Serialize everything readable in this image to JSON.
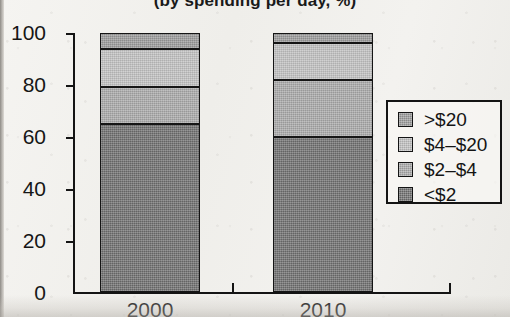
{
  "chart_data": {
    "type": "bar",
    "title": "(by spending per day, %)",
    "xlabel": "",
    "ylabel": "",
    "categories": [
      "2000",
      "2010"
    ],
    "series": [
      {
        "name": "<$2",
        "values": [
          65,
          60
        ],
        "color": "#6e6e6e"
      },
      {
        "name": "$2–$4",
        "values": [
          14,
          22
        ],
        "color": "#a8a8a8"
      },
      {
        "name": "$4–$20",
        "values": [
          15,
          14
        ],
        "color": "#c0c0c0"
      },
      {
        "name": ">$20",
        "values": [
          6,
          4
        ],
        "color": "#9a9a9a"
      }
    ],
    "stacked": true,
    "ylim": [
      0,
      100
    ],
    "yticks": [
      0,
      20,
      40,
      60,
      80,
      100
    ],
    "ytick_labels": [
      "0",
      "20",
      "40",
      "60",
      "80",
      "100"
    ],
    "xtick_labels": [
      "2000",
      "2010"
    ],
    "grid": false,
    "legend_position": "right",
    "legend_entries": [
      ">$20",
      "$4–$20",
      "$2–$4",
      "<$2"
    ],
    "legend_colors": [
      "#9a9a9a",
      "#c0c0c0",
      "#a8a8a8",
      "#6e6e6e"
    ]
  },
  "axes": {
    "y_tick_0": "0",
    "y_tick_1": "20",
    "y_tick_2": "40",
    "y_tick_3": "60",
    "y_tick_4": "80",
    "y_tick_5": "100"
  },
  "legend": {
    "row_0": ">$20",
    "row_1": "$4–$20",
    "row_2": "$2–$4",
    "row_3": "<$2"
  },
  "xaxis": {
    "cat_0": "2000",
    "cat_1": "2010"
  }
}
